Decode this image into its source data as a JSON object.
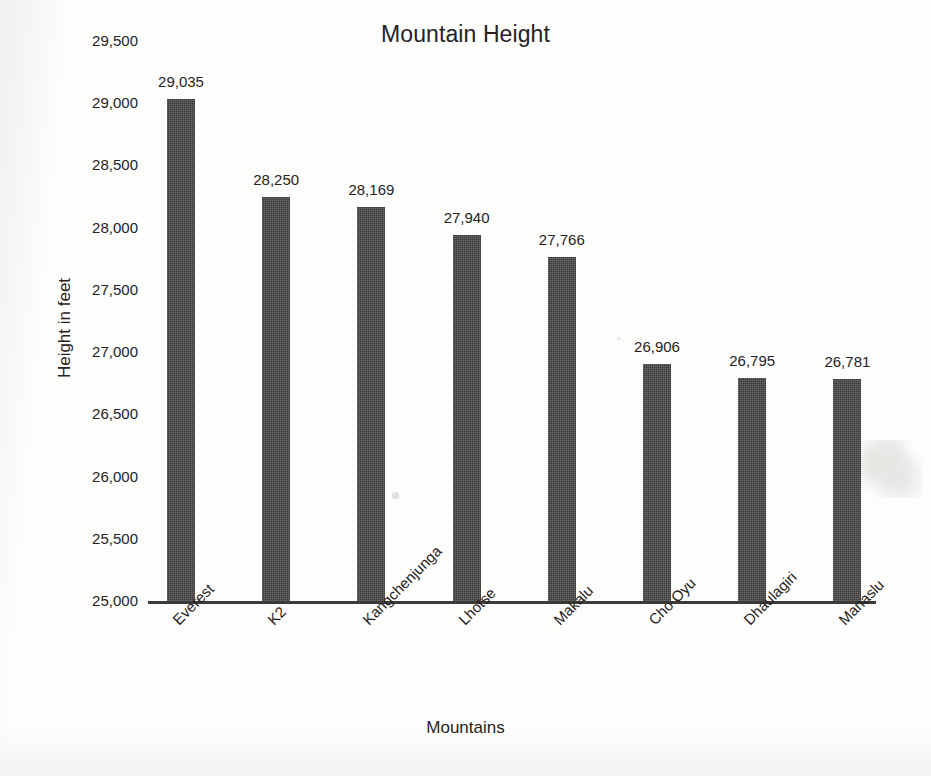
{
  "chart_data": {
    "type": "bar",
    "title": "Mountain Height",
    "xlabel": "Mountains",
    "ylabel": "Height in feet",
    "categories": [
      "Everest",
      "K2",
      "Kangchenjunga",
      "Lhotse",
      "Makalu",
      "Cho Oyu",
      "Dhaulagiri",
      "Manaslu"
    ],
    "values": [
      29035,
      28250,
      28169,
      27940,
      27766,
      26906,
      26795,
      26781
    ],
    "value_labels": [
      "29,035",
      "28,250",
      "28,169",
      "27,940",
      "27,766",
      "26,906",
      "26,795",
      "26,781"
    ],
    "ylim": [
      25000,
      29500
    ],
    "ytick_step": 500,
    "ytick_labels": [
      "29,500",
      "29,000",
      "28,500",
      "28,000",
      "27,500",
      "27,000",
      "26,500",
      "26,000",
      "25,500",
      "25,000"
    ],
    "ytick_values": [
      29500,
      29000,
      28500,
      28000,
      27500,
      27000,
      26500,
      26000,
      25500,
      25000
    ],
    "grid": false,
    "legend": false,
    "bar_color": "#3c3a39",
    "axis_color": "#3b3a38",
    "text_color": "#262223",
    "background_color": "#fdfdfc",
    "category_label_rotation": -45
  }
}
